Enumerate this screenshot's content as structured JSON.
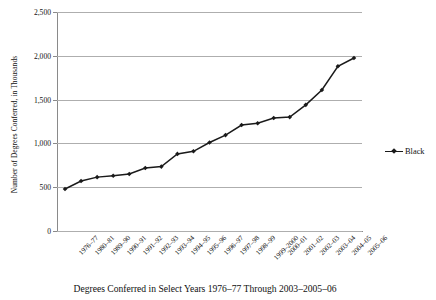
{
  "chart_data": {
    "type": "line",
    "title": "",
    "caption": "Degrees Conferred in Select Years 1976–77 Through 2003–2005–06",
    "xlabel": "",
    "ylabel": "Number of Degrees Conferred, in Thousands",
    "ylim": [
      0,
      2500
    ],
    "yticks": [
      0,
      500,
      1000,
      1500,
      2000,
      2500
    ],
    "ytick_labels": [
      "0",
      "500",
      "1,000",
      "1,500",
      "2,000",
      "2,500"
    ],
    "grid": true,
    "legend_position": "right",
    "marker": "diamond",
    "line_color": "#1a1a1a",
    "categories": [
      "1976–77",
      "1980–81",
      "1989–90",
      "1990–91",
      "1991–92",
      "1992–93",
      "1993–94",
      "1994–95",
      "1995–96",
      "1996–97",
      "1997–98",
      "1998–99",
      "1999–2000",
      "2000–01",
      "2001–02",
      "2002–03",
      "2003–04",
      "2004–05",
      "2005–06"
    ],
    "series": [
      {
        "name": "Black",
        "values": [
          480,
          570,
          615,
          630,
          650,
          720,
          735,
          880,
          910,
          1010,
          1095,
          1210,
          1230,
          1290,
          1300,
          1440,
          1610,
          1880,
          1975
        ]
      }
    ]
  },
  "legend": {
    "entries": [
      {
        "label": "Black"
      }
    ]
  }
}
